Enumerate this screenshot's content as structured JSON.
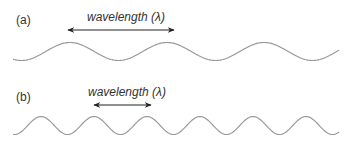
{
  "panels": [
    {
      "label": "(a)",
      "arrow_label": "wavelength (λ)",
      "wave": {
        "x_start": 13,
        "x_end": 339,
        "center_y": 51.5,
        "amplitude": 9,
        "period": 97,
        "first_peak_x": 70
      },
      "arrow": {
        "x1": 68,
        "x2": 174,
        "y": 30
      }
    },
    {
      "label": "(b)",
      "arrow_label": "wavelength (λ)",
      "wave": {
        "x_start": 13,
        "x_end": 339,
        "center_y": 125.5,
        "amplitude": 9,
        "period": 53,
        "first_peak_x": 41
      },
      "arrow": {
        "x1": 94,
        "x2": 151,
        "y": 105
      }
    }
  ],
  "colors": {
    "wave": "#999999",
    "arrow": "#222222",
    "text": "#333333"
  }
}
